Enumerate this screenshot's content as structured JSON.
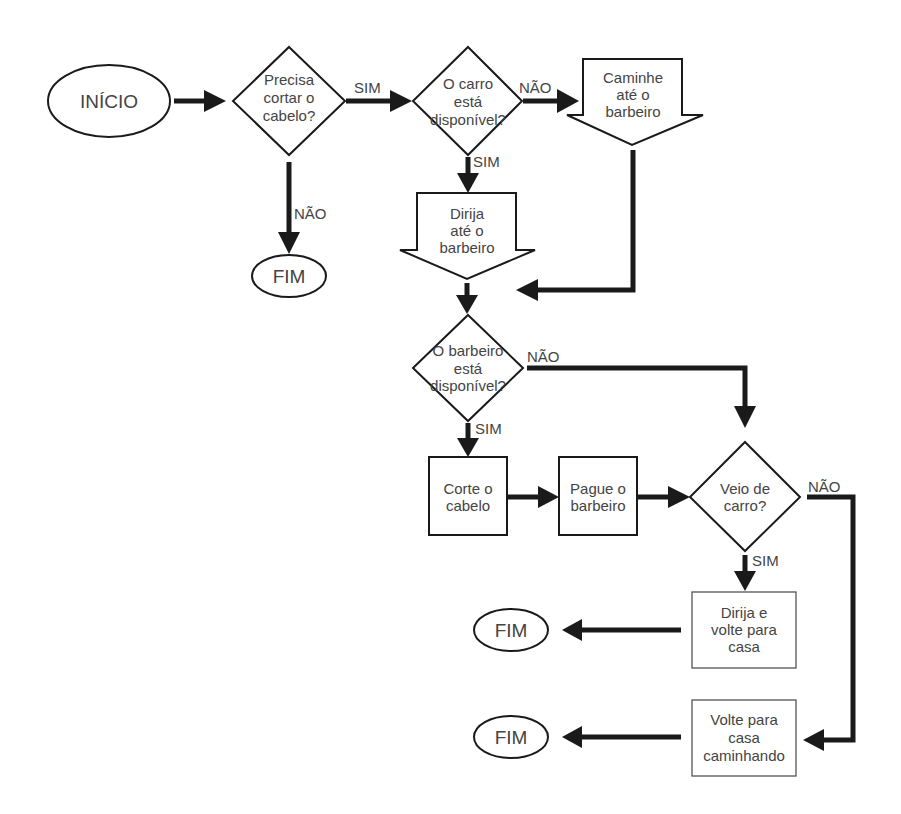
{
  "diagram": {
    "type": "flowchart",
    "nodes": {
      "start": {
        "label": "INÍCIO"
      },
      "q_haircut": {
        "lines": [
          "Precisa",
          "cortar o",
          "cabelo?"
        ]
      },
      "end_no_haircut": {
        "label": "FIM"
      },
      "q_car": {
        "lines": [
          "O carro",
          "está",
          "disponível?"
        ]
      },
      "walk": {
        "lines": [
          "Caminhe",
          "até o",
          "barbeiro"
        ]
      },
      "drive": {
        "lines": [
          "Dirija",
          "até o",
          "barbeiro"
        ]
      },
      "q_barber": {
        "lines": [
          "O barbeiro",
          "está",
          "disponível?"
        ]
      },
      "cut": {
        "lines": [
          "Corte o",
          "cabelo"
        ]
      },
      "pay": {
        "lines": [
          "Pague o",
          "barbeiro"
        ]
      },
      "q_came_by_car": {
        "lines": [
          "Veio de",
          "carro?"
        ]
      },
      "drive_home": {
        "lines": [
          "Dirija e",
          "volte para",
          "casa"
        ]
      },
      "walk_home": {
        "lines": [
          "Volte para",
          "casa",
          "caminhando"
        ]
      },
      "end_drive": {
        "label": "FIM"
      },
      "end_walk": {
        "label": "FIM"
      }
    },
    "edge_labels": {
      "haircut_yes": "SIM",
      "haircut_no": "NÃO",
      "car_yes": "SIM",
      "car_no": "NÃO",
      "barber_yes": "SIM",
      "barber_no": "NÃO",
      "came_car_yes": "SIM",
      "came_car_no": "NÃO"
    }
  }
}
